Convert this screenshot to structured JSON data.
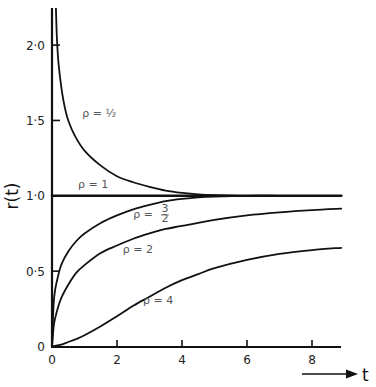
{
  "chart_data": {
    "type": "line",
    "title": "",
    "xlabel": "t",
    "ylabel": "r(t)",
    "xlim": [
      0,
      8.9
    ],
    "ylim": [
      0,
      2.25
    ],
    "grid": false,
    "legend": "inline labels",
    "x_ticks": [
      {
        "value": 0,
        "label": "0"
      },
      {
        "value": 2,
        "label": "2"
      },
      {
        "value": 4,
        "label": "4"
      },
      {
        "value": 6,
        "label": "6"
      },
      {
        "value": 8,
        "label": "8"
      }
    ],
    "y_ticks": [
      {
        "value": 0,
        "label": "0"
      },
      {
        "value": 0.5,
        "label": "0·5"
      },
      {
        "value": 1.0,
        "label": "1·0"
      },
      {
        "value": 1.5,
        "label": "1·5"
      },
      {
        "value": 2.0,
        "label": "2·0"
      }
    ],
    "series": [
      {
        "name": "ρ = ½",
        "label": "ρ  =  ½",
        "label_pos": [
          0.93,
          1.52
        ],
        "x": [
          0.12,
          0.15,
          0.2,
          0.3,
          0.4,
          0.5,
          0.7,
          1.0,
          1.5,
          2.0,
          2.5,
          3.0,
          3.5,
          4.0,
          4.5,
          5.0,
          6.0,
          7.0,
          8.0,
          8.9
        ],
        "y": [
          2.25,
          2.05,
          1.88,
          1.7,
          1.58,
          1.5,
          1.4,
          1.3,
          1.2,
          1.13,
          1.09,
          1.06,
          1.035,
          1.02,
          1.01,
          1.005,
          1.0,
          1.0,
          1.0,
          1.0
        ]
      },
      {
        "name": "ρ = 1",
        "label": "ρ  =  1",
        "label_pos": [
          0.8,
          1.05
        ],
        "x": [
          0,
          8.9
        ],
        "y": [
          1.0,
          1.0
        ]
      },
      {
        "name": "ρ = 3/2",
        "label": "ρ  =",
        "label_frac": [
          "3",
          "2"
        ],
        "label_pos": [
          2.5,
          0.85
        ],
        "x": [
          0,
          0.05,
          0.1,
          0.2,
          0.3,
          0.5,
          0.75,
          1.0,
          1.5,
          2.0,
          2.5,
          3.0,
          3.5,
          4.0,
          4.5,
          5.0,
          6.0,
          7.0,
          8.0,
          8.9
        ],
        "y": [
          0,
          0.28,
          0.38,
          0.48,
          0.55,
          0.63,
          0.7,
          0.75,
          0.82,
          0.87,
          0.91,
          0.94,
          0.965,
          0.98,
          0.99,
          0.995,
          1.0,
          1.0,
          1.0,
          1.0
        ]
      },
      {
        "name": "ρ = 2",
        "label": "ρ  =  2",
        "label_pos": [
          2.18,
          0.62
        ],
        "x": [
          0,
          0.05,
          0.1,
          0.2,
          0.3,
          0.5,
          0.75,
          1.0,
          1.5,
          2.0,
          2.5,
          3.0,
          3.5,
          4.0,
          5.0,
          6.0,
          7.0,
          8.0,
          8.9
        ],
        "y": [
          0,
          0.13,
          0.19,
          0.27,
          0.33,
          0.41,
          0.49,
          0.54,
          0.62,
          0.67,
          0.715,
          0.75,
          0.78,
          0.8,
          0.84,
          0.87,
          0.89,
          0.905,
          0.915
        ]
      },
      {
        "name": "ρ = 4",
        "label": "ρ  =  4",
        "label_pos": [
          2.8,
          0.28
        ],
        "x": [
          0,
          0.25,
          0.5,
          0.75,
          1.0,
          1.5,
          2.0,
          2.5,
          3.0,
          3.5,
          4.0,
          4.5,
          5.0,
          6.0,
          7.0,
          8.0,
          8.9
        ],
        "y": [
          0,
          0.01,
          0.03,
          0.05,
          0.075,
          0.135,
          0.2,
          0.27,
          0.33,
          0.39,
          0.44,
          0.48,
          0.52,
          0.575,
          0.615,
          0.64,
          0.655
        ]
      }
    ]
  },
  "axes": {
    "y_title": "r(t)",
    "x_title": "t"
  }
}
